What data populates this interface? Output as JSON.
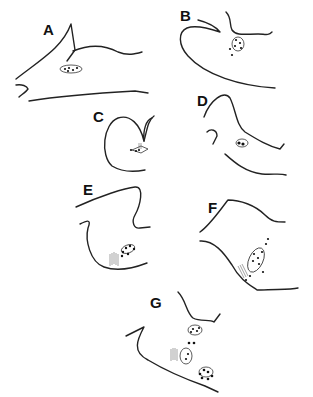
{
  "figure": {
    "panels": [
      {
        "id": "A",
        "label": "A"
      },
      {
        "id": "B",
        "label": "B"
      },
      {
        "id": "C",
        "label": "C"
      },
      {
        "id": "D",
        "label": "D"
      },
      {
        "id": "E",
        "label": "E"
      },
      {
        "id": "F",
        "label": "F"
      },
      {
        "id": "G",
        "label": "G"
      }
    ],
    "colors": {
      "line": "#222222",
      "background": "#ffffff"
    }
  }
}
